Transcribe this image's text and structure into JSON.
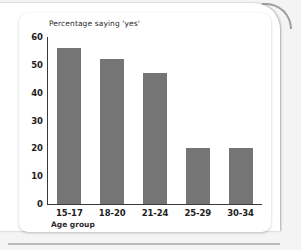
{
  "chart_data": {
    "type": "bar",
    "title": "Percentage saying 'yes'",
    "xlabel": "Age group",
    "ylabel": "",
    "categories": [
      "15-17",
      "18-20",
      "21-24",
      "25-29",
      "30-34"
    ],
    "values": [
      56,
      52,
      47,
      20,
      20
    ],
    "ylim": [
      0,
      60
    ],
    "yticks": [
      0,
      10,
      20,
      30,
      40,
      50,
      60
    ],
    "ytick_labels": [
      "0",
      "10",
      "20",
      "30",
      "40",
      "50",
      "60"
    ],
    "grid": false,
    "legend": "none",
    "bar_color": "#757575",
    "axis_color": "#3a3a3a",
    "background": "#ffffff"
  },
  "figure": {
    "card_background": "#ffffff",
    "page_background": "#f2f2f2",
    "rule_color": "#b9bcc0"
  }
}
